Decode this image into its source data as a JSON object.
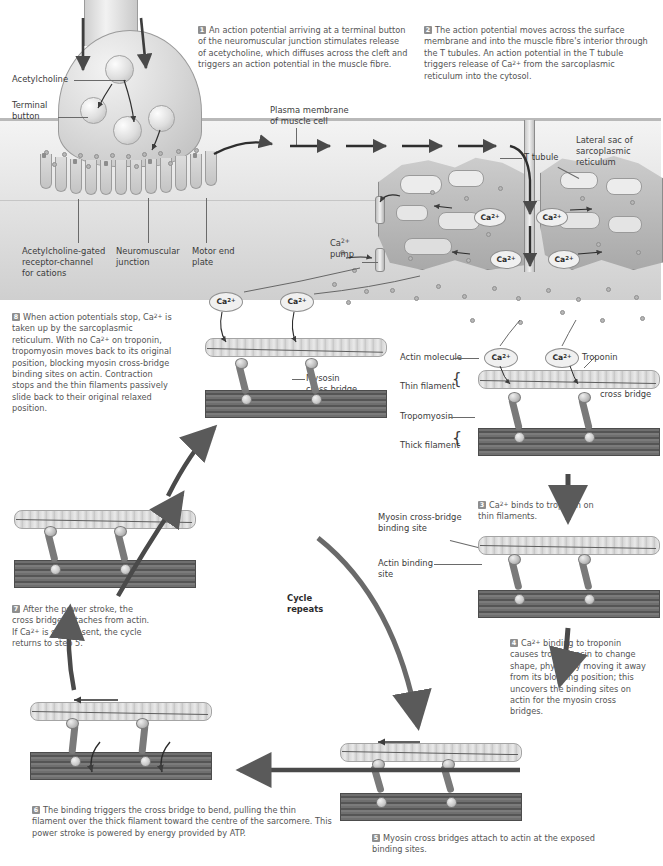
{
  "steps": [
    {
      "id": 1,
      "number": "1",
      "text": "An action potential arriving at a terminal button of the neuromuscular junction stimulates release of acetycholine, which diffuses across the cleft and triggers an action potential in the muscle fibre."
    },
    {
      "id": 2,
      "number": "2",
      "text": "The action potential moves across the surface membrane and into the muscle fibre's interior through the T tubules. An action potential in the T tubule triggers release of Ca2+ from the sarcoplasmic reticulum into the cytosol."
    },
    {
      "id": 3,
      "number": "3",
      "text": "Ca2+ binds to troponin on thin filaments."
    },
    {
      "id": 4,
      "number": "4",
      "text": "Ca2+ binding to troponin causes tropomyosin to change shape, physically moving it away from its blocking position; this uncovers the binding sites on actin for the myosin cross bridges."
    },
    {
      "id": 5,
      "number": "5",
      "text": "Myosin cross bridges attach to actin at the exposed binding sites."
    },
    {
      "id": 6,
      "number": "6",
      "text": "The binding triggers the cross bridge to bend, pulling the thin filament over the thick filament toward the centre of the sarcomere. This power stroke is powered by energy provided by ATP."
    },
    {
      "id": 7,
      "number": "7",
      "text": "After the power stroke, the cross bridge detaches from actin. If Ca2+ is still present, the cycle returns to step 5."
    },
    {
      "id": 8,
      "number": "8",
      "text": "When action potentials stop, Ca2+ is taken up by the sarcoplasmic reticulum. With no Ca2+ on troponin, tropomyosin moves back to its original position, blocking myosin cross-bridge binding sites on actin. Contraction stops and the thin filaments passively slide back to their original relaxed position."
    }
  ],
  "labels": {
    "acetylcholine": "Acetylcholine",
    "terminal_button": "Terminal\nbutton",
    "plasma_membrane": "Plasma membrane\nof muscle cell",
    "ach_receptor": "Acetylcholine-gated\nreceptor-channel\nfor cations",
    "nmj": "Neuromuscular\njunction",
    "motor_end_plate": "Motor end\nplate",
    "t_tubule": "T tubule",
    "lateral_sac": "Lateral sac of\nsarcoplasmic\nreticulum",
    "ca_pump": "Ca2+\npump",
    "myosin_cross_bridge": "Mysosin\ncross bridge",
    "actin_molecule": "Actin molecule",
    "thin_filament": "Thin filament",
    "tropomyosin": "Tropomyosin",
    "thick_filament": "Thick filament",
    "troponin": "Troponin",
    "myosin_binding_site": "Myosin cross-bridge\nbinding site",
    "actin_binding_site": "Actin binding\nsite",
    "cycle_repeats": "Cycle\nrepeats"
  },
  "ion_labels": {
    "calcium": "Ca",
    "calcium_charge": "2+"
  },
  "colors": {
    "text": "#555555",
    "label_text": "#3b3b3b",
    "step_badge": "#8e8e8e",
    "thick_filament": "#6f6f6f",
    "thin_filament": "#d6d6d6",
    "leader_line": "#6a6a6a",
    "background": "#ffffff"
  }
}
